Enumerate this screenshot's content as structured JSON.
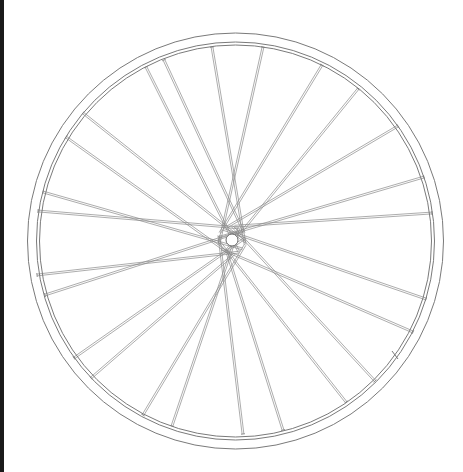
{
  "image": {
    "subject": "Line drawing of a bicycle wheel",
    "width": 463,
    "height": 472
  },
  "colors": {
    "background": "#ffffff",
    "edge_strip": "#1a1a1a",
    "rim_stroke": "#7a7a7a",
    "spoke_stroke": "#8a8a8a",
    "hub_stroke": "#6a6a6a"
  },
  "wheel": {
    "center": [
      235.5,
      241
    ],
    "rim_outer_radius": 208,
    "rim_inner_radius_1": 199,
    "rim_inner_radius_2": 196,
    "hub_center": [
      232,
      240
    ],
    "hub_radius": 6,
    "hub_flange_radius": 14,
    "valve": {
      "x1": 392,
      "y1": 351,
      "x2": 398,
      "y2": 359
    },
    "spokes": [
      {
        "rim": [
          212,
          47
        ],
        "hub_angle": 20
      },
      {
        "rim": [
          263,
          47
        ],
        "hub_angle": 160
      },
      {
        "rim": [
          164,
          60
        ],
        "hub_angle": 330
      },
      {
        "rim": [
          146,
          67
        ],
        "hub_angle": 60
      },
      {
        "rim": [
          322,
          65
        ],
        "hub_angle": 210
      },
      {
        "rim": [
          358,
          89
        ],
        "hub_angle": 120
      },
      {
        "rim": [
          398,
          126
        ],
        "hub_angle": 250
      },
      {
        "rim": [
          83,
          113
        ],
        "hub_angle": 10
      },
      {
        "rim": [
          66,
          137
        ],
        "hub_angle": 100
      },
      {
        "rim": [
          424,
          177
        ],
        "hub_angle": 190
      },
      {
        "rim": [
          432,
          213
        ],
        "hub_angle": 280
      },
      {
        "rim": [
          43,
          192
        ],
        "hub_angle": 40
      },
      {
        "rim": [
          38,
          211
        ],
        "hub_angle": 300
      },
      {
        "rim": [
          37,
          275
        ],
        "hub_angle": 60
      },
      {
        "rim": [
          45,
          295
        ],
        "hub_angle": 320
      },
      {
        "rim": [
          426,
          299
        ],
        "hub_angle": 230
      },
      {
        "rim": [
          413,
          332
        ],
        "hub_angle": 140
      },
      {
        "rim": [
          74,
          358
        ],
        "hub_angle": 350
      },
      {
        "rim": [
          91,
          378
        ],
        "hub_angle": 80
      },
      {
        "rim": [
          375,
          381
        ],
        "hub_angle": 270
      },
      {
        "rim": [
          346,
          402
        ],
        "hub_angle": 180
      },
      {
        "rim": [
          143,
          415
        ],
        "hub_angle": 20
      },
      {
        "rim": [
          172,
          426
        ],
        "hub_angle": 300
      },
      {
        "rim": [
          243,
          434
        ],
        "hub_angle": 200
      },
      {
        "rim": [
          283,
          430
        ],
        "hub_angle": 110
      }
    ]
  }
}
